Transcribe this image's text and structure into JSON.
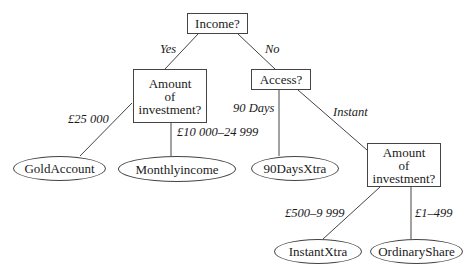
{
  "diagram": {
    "type": "decision-tree",
    "line_color": "#444444",
    "decision_nodes": {
      "income": {
        "label": "Income?"
      },
      "amount_left": {
        "lines": [
          "Amount",
          "of",
          "investment?"
        ]
      },
      "access": {
        "label": "Access?"
      },
      "amount_right": {
        "lines": [
          "Amount",
          "of",
          "investment?"
        ]
      }
    },
    "leaf_nodes": {
      "gold_account": {
        "label": "GoldAccount"
      },
      "monthly_income": {
        "label": "Monthlyincome"
      },
      "ninety_days_xtra": {
        "label": "90DaysXtra"
      },
      "instant_xtra": {
        "label": "InstantXtra"
      },
      "ordinary_share": {
        "label": "OrdinaryShare"
      }
    },
    "edge_labels": {
      "yes": "Yes",
      "no": "No",
      "gbp_25000": "£25 000",
      "gbp_10000_24999": "£10 000–24 999",
      "ninety_days": "90 Days",
      "instant": "Instant",
      "gbp_500_9999": "£500–9 999",
      "gbp_1_499": "£1–499"
    }
  }
}
